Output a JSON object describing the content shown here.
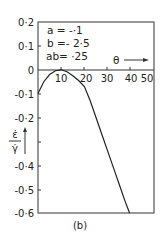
{
  "chart_data": {
    "type": "line",
    "title": "",
    "caption": "(b)",
    "xlabel": "θ",
    "ylabel": "ε̇/γ̇",
    "xlim": [
      0,
      50
    ],
    "ylim": [
      -0.6,
      0.2
    ],
    "grid": false,
    "x_ticks": [
      "10",
      "20",
      "30",
      "40",
      "50"
    ],
    "y_ticks": [
      "0.2",
      "0.1",
      "0",
      "-0.1",
      "-0.2",
      "-0.4",
      "-0.5",
      "-0.6"
    ],
    "annotations": [
      "a = -.1",
      "b = - 2.5",
      "ab = .25"
    ],
    "series": [
      {
        "name": "ε̇/γ̇ vs θ",
        "x": [
          0,
          2.5,
          5,
          7.5,
          10,
          12.5,
          15,
          17.5,
          20,
          22.5,
          25,
          27.5,
          30,
          32.5,
          35,
          37.5,
          39.5
        ],
        "y": [
          -0.1,
          -0.05,
          -0.02,
          -0.004,
          0.0,
          -0.008,
          -0.025,
          -0.045,
          -0.07,
          -0.13,
          -0.2,
          -0.27,
          -0.34,
          -0.41,
          -0.48,
          -0.55,
          -0.6
        ]
      }
    ]
  },
  "labels": {
    "y_ticks": [
      "0·2",
      "0·1",
      "0",
      "-0·1",
      "-0·2",
      "-0·4",
      "-0·5",
      "-0·6"
    ],
    "x_ticks": [
      "10",
      "20",
      "30",
      "40",
      "50"
    ],
    "annot_a": "a = -·1",
    "annot_b": "b =- 2·5",
    "annot_ab": "ab= ·25",
    "x_axis_label": "θ",
    "y_axis_num": "ε̇",
    "y_axis_den": "γ̇",
    "caption": "(b)"
  }
}
